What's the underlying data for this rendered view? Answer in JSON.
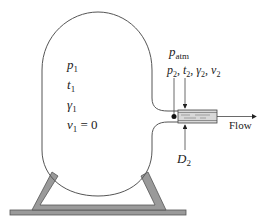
{
  "diagram": {
    "type": "tank-nozzle-flow",
    "tank_labels": {
      "pressure": {
        "symbol": "p",
        "sub": "1"
      },
      "temperature": {
        "symbol": "t",
        "sub": "1"
      },
      "specific_weight": {
        "symbol": "γ",
        "sub": "1"
      },
      "velocity": {
        "symbol": "v",
        "sub": "1",
        "suffix": " = 0"
      }
    },
    "atmosphere_label": {
      "symbol": "p",
      "sub": "atm"
    },
    "exit_state_label": {
      "items": [
        {
          "symbol": "p",
          "sub": "2"
        },
        {
          "symbol": "t",
          "sub": "2"
        },
        {
          "symbol": "γ",
          "sub": "2"
        },
        {
          "symbol": "v",
          "sub": "2"
        }
      ],
      "separator": ", "
    },
    "diameter_label": {
      "symbol": "D",
      "sub": "2"
    },
    "flow_label": "Flow",
    "colors": {
      "outline": "#555555",
      "stand_fill": "#9a9a9a",
      "stand_stroke": "#555555",
      "nozzle_fill": "#d8d8d8",
      "text": "#222222"
    }
  }
}
